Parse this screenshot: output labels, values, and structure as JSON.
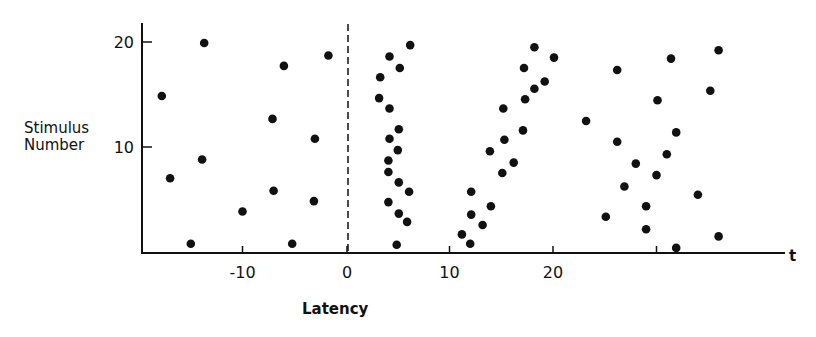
{
  "chart_data": {
    "type": "scatter",
    "title": "",
    "xlabel": "Latency",
    "ylabel": "Stimulus Number",
    "x_axis_end_label": "t",
    "xticks": [
      -10,
      0,
      10,
      20,
      30
    ],
    "xtick_labels": [
      "-10",
      "0",
      "10",
      "20",
      ""
    ],
    "yticks": [
      10,
      20
    ],
    "ytick_labels": [
      "10",
      "20"
    ],
    "xlim": [
      -20,
      42
    ],
    "ylim": [
      0,
      22
    ],
    "grid": false,
    "legend": null,
    "reference_line": {
      "x": 0,
      "style": "dashed"
    },
    "series": [
      {
        "name": "points",
        "marker": "filled-circle",
        "color": "#111111",
        "points": [
          {
            "x": -13.7,
            "y": 20
          },
          {
            "x": -1.7,
            "y": 18.8
          },
          {
            "x": -6.0,
            "y": 17.8
          },
          {
            "x": -17.8,
            "y": 14.9
          },
          {
            "x": -7.1,
            "y": 12.7
          },
          {
            "x": -3.0,
            "y": 10.8
          },
          {
            "x": -13.9,
            "y": 8.8
          },
          {
            "x": -17.0,
            "y": 7.0
          },
          {
            "x": -7.0,
            "y": 5.8
          },
          {
            "x": -3.1,
            "y": 4.8
          },
          {
            "x": -10.0,
            "y": 3.8
          },
          {
            "x": -15.0,
            "y": 0.7
          },
          {
            "x": -5.2,
            "y": 0.7
          },
          {
            "x": 6.2,
            "y": 19.8
          },
          {
            "x": 4.2,
            "y": 18.7
          },
          {
            "x": 5.2,
            "y": 17.6
          },
          {
            "x": 3.3,
            "y": 16.7
          },
          {
            "x": 3.2,
            "y": 14.7
          },
          {
            "x": 4.2,
            "y": 13.7
          },
          {
            "x": 5.1,
            "y": 11.7
          },
          {
            "x": 4.2,
            "y": 10.8
          },
          {
            "x": 5.0,
            "y": 9.7
          },
          {
            "x": 4.1,
            "y": 8.7
          },
          {
            "x": 4.1,
            "y": 7.6
          },
          {
            "x": 5.1,
            "y": 6.6
          },
          {
            "x": 6.1,
            "y": 5.7
          },
          {
            "x": 4.1,
            "y": 4.7
          },
          {
            "x": 5.1,
            "y": 3.6
          },
          {
            "x": 5.9,
            "y": 2.8
          },
          {
            "x": 4.9,
            "y": 0.6
          },
          {
            "x": 18.2,
            "y": 19.6
          },
          {
            "x": 20.1,
            "y": 18.6
          },
          {
            "x": 17.2,
            "y": 17.6
          },
          {
            "x": 19.2,
            "y": 16.3
          },
          {
            "x": 18.2,
            "y": 15.6
          },
          {
            "x": 17.3,
            "y": 14.6
          },
          {
            "x": 15.2,
            "y": 13.7
          },
          {
            "x": 17.1,
            "y": 11.6
          },
          {
            "x": 15.3,
            "y": 10.7
          },
          {
            "x": 13.9,
            "y": 9.6
          },
          {
            "x": 16.2,
            "y": 8.5
          },
          {
            "x": 15.1,
            "y": 7.5
          },
          {
            "x": 12.1,
            "y": 5.7
          },
          {
            "x": 14.0,
            "y": 4.3
          },
          {
            "x": 12.1,
            "y": 3.5
          },
          {
            "x": 13.2,
            "y": 2.5
          },
          {
            "x": 11.2,
            "y": 1.6
          },
          {
            "x": 12.0,
            "y": 0.7
          },
          {
            "x": 36.0,
            "y": 19.3
          },
          {
            "x": 31.4,
            "y": 18.5
          },
          {
            "x": 26.2,
            "y": 17.4
          },
          {
            "x": 35.2,
            "y": 15.4
          },
          {
            "x": 30.1,
            "y": 14.5
          },
          {
            "x": 23.2,
            "y": 12.5
          },
          {
            "x": 31.9,
            "y": 11.4
          },
          {
            "x": 26.2,
            "y": 10.5
          },
          {
            "x": 31.0,
            "y": 9.3
          },
          {
            "x": 28.0,
            "y": 8.4
          },
          {
            "x": 30.0,
            "y": 7.3
          },
          {
            "x": 26.9,
            "y": 6.2
          },
          {
            "x": 34.0,
            "y": 5.4
          },
          {
            "x": 29.0,
            "y": 4.3
          },
          {
            "x": 25.1,
            "y": 3.3
          },
          {
            "x": 29.0,
            "y": 2.1
          },
          {
            "x": 36.0,
            "y": 1.4
          },
          {
            "x": 31.9,
            "y": 0.3
          }
        ]
      }
    ]
  },
  "labels": {
    "ylabel_line1": "Stimulus",
    "ylabel_line2": "Number",
    "xlabel": "Latency",
    "x_end": "t"
  },
  "colors": {
    "ink": "#111111",
    "background": "#ffffff"
  }
}
